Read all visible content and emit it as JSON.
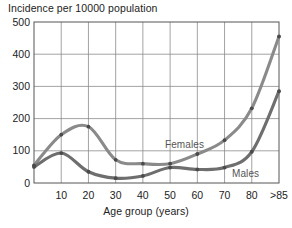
{
  "chart_data": {
    "type": "line",
    "title": "Incidence per 10000 population",
    "xlabel": "Age group (years)",
    "ylabel": "Incidence per 10000 population",
    "grid": true,
    "legend_position": "inline-annotation",
    "ylim": [
      0,
      500
    ],
    "yticks": [
      0,
      100,
      200,
      300,
      400,
      500
    ],
    "ytick_labels": [
      "0",
      "100",
      "200",
      "300",
      "400",
      "500"
    ],
    "x": [
      0,
      10,
      20,
      30,
      40,
      50,
      60,
      70,
      80,
      85
    ],
    "xticks": [
      10,
      20,
      30,
      40,
      50,
      60,
      70,
      80,
      85
    ],
    "xtick_labels": [
      "10",
      "20",
      "30",
      "40",
      "50",
      "60",
      "70",
      "80",
      ">85"
    ],
    "series": [
      {
        "name": "Females",
        "color": "#8a8a8a",
        "values": [
          55,
          150,
          175,
          72,
          60,
          60,
          90,
          133,
          232,
          455
        ]
      },
      {
        "name": "Males",
        "color": "#6e6e6e",
        "values": [
          50,
          93,
          35,
          15,
          22,
          48,
          42,
          48,
          97,
          285
        ]
      }
    ],
    "annotations": [
      {
        "text": "Females",
        "x_px": 165,
        "y_px": 139
      },
      {
        "text": "Males",
        "x_px": 232,
        "y_px": 168
      }
    ]
  },
  "axes": {
    "plot_left_px": 34,
    "plot_right_px": 279,
    "plot_top_px": 22,
    "plot_bottom_px": 183
  },
  "colors": {
    "grid": "#8c8c8c",
    "frame": "#555555",
    "females_line": "#8f8f8f",
    "males_line": "#6b6b6b",
    "marker": "#4a4a4a",
    "text": "#222222"
  }
}
